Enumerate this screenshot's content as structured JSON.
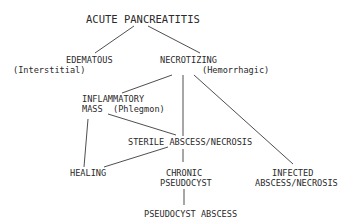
{
  "diagram": {
    "title": "ACUTE PANCREATITIS",
    "nodes": {
      "edematous": {
        "label": "EDEMATOUS",
        "sub": "(Interstitial)"
      },
      "necrotizing": {
        "label": "NECROTIZING",
        "sub": "(Hemorrhagic)"
      },
      "inflammatory_mass": {
        "line1": "INFLAMMATORY",
        "line2": "MASS",
        "sub": "(Phlegmon)"
      },
      "sterile": {
        "label": "STERILE ABSCESS/NECROSIS"
      },
      "healing": {
        "label": "HEALING"
      },
      "chronic_pseudocyst": {
        "line1": "CHRONIC",
        "line2": "PSEUDOCYST"
      },
      "infected": {
        "line1": "INFECTED",
        "line2": "ABSCESS/NECROSIS"
      },
      "pseudocyst_abscess": {
        "label": "PSEUDOCYST ABSCESS"
      }
    },
    "edges": [
      [
        "ACUTE PANCREATITIS",
        "EDEMATOUS"
      ],
      [
        "ACUTE PANCREATITIS",
        "NECROTIZING"
      ],
      [
        "NECROTIZING",
        "INFLAMMATORY MASS"
      ],
      [
        "NECROTIZING",
        "STERILE ABSCESS/NECROSIS"
      ],
      [
        "NECROTIZING",
        "INFECTED ABSCESS/NECROSIS"
      ],
      [
        "INFLAMMATORY MASS",
        "STERILE ABSCESS/NECROSIS"
      ],
      [
        "INFLAMMATORY MASS",
        "HEALING"
      ],
      [
        "STERILE ABSCESS/NECROSIS",
        "HEALING"
      ],
      [
        "STERILE ABSCESS/NECROSIS",
        "CHRONIC PSEUDOCYST"
      ],
      [
        "CHRONIC PSEUDOCYST",
        "PSEUDOCYST ABSCESS"
      ]
    ],
    "colors": {
      "ink": "#2a2a2a",
      "background": "#ffffff"
    }
  }
}
